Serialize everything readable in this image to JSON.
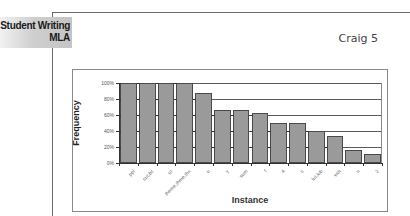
{
  "header": {
    "section_tab_line1": "Student Writing",
    "section_tab_line2": "MLA",
    "running_head": "Craig 5"
  },
  "chart": {
    "y_axis_title": "Frequency",
    "x_axis_title": "Instance",
    "y_ticks": [
      "100%",
      "80%",
      "60%",
      "40%",
      "20%",
      "0%"
    ],
    "bar_color": "#9a9a9a"
  },
  "chart_data": {
    "type": "bar",
    "title": "",
    "xlabel": "Instance",
    "ylabel": "Frequency",
    "ylim": [
      0,
      100
    ],
    "y_unit": "%",
    "grid": true,
    "legend": "none",
    "categories": [
      "ppl",
      "cut,bc",
      "ur",
      "theme,thme,thx",
      "u",
      "y",
      "sum",
      "f",
      "4",
      "c",
      "lut,lub",
      "wot",
      "n",
      "2"
    ],
    "values": [
      100,
      100,
      100,
      100,
      88,
      66,
      66,
      63,
      50,
      50,
      40,
      34,
      16,
      11
    ],
    "y_tick_labels": [
      "0%",
      "20%",
      "40%",
      "60%",
      "80%",
      "100%"
    ]
  }
}
